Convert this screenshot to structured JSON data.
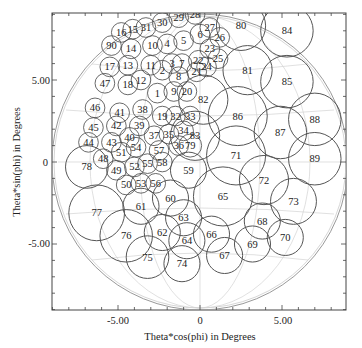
{
  "figure": {
    "xlabel": "Theta*cos(phi) in Degrees",
    "ylabel": "Theta*sin(phi) in Degrees",
    "x_ticks": [
      "-5.00",
      "0",
      "5.00"
    ],
    "y_ticks": [
      "5.00",
      "0",
      "-5.00"
    ],
    "colors": {
      "frame": "#444444",
      "circle": "#333333",
      "grid": "#bbbbbb",
      "text": "#222222"
    }
  },
  "chart_data": {
    "type": "scatter",
    "title": "",
    "xlabel": "Theta*cos(phi) in Degrees",
    "ylabel": "Theta*sin(phi) in Degrees",
    "xlim": [
      -9,
      9
    ],
    "ylim": [
      -9,
      9
    ],
    "grid": false,
    "beams": [
      {
        "id": "1",
        "x": -2.6,
        "y": 4.2,
        "r": 0.6
      },
      {
        "id": "2",
        "x": -2.3,
        "y": 5.6,
        "r": 0.6
      },
      {
        "id": "3",
        "x": -1.7,
        "y": 6.0,
        "r": 0.6
      },
      {
        "id": "4",
        "x": -2.0,
        "y": 7.2,
        "r": 0.6
      },
      {
        "id": "5",
        "x": -1.0,
        "y": 7.4,
        "r": 0.6
      },
      {
        "id": "6",
        "x": 0.0,
        "y": 7.8,
        "r": 0.6
      },
      {
        "id": "7",
        "x": -1.1,
        "y": 6.0,
        "r": 0.6
      },
      {
        "id": "8",
        "x": -1.3,
        "y": 5.2,
        "r": 0.6
      },
      {
        "id": "9",
        "x": -1.6,
        "y": 4.3,
        "r": 0.6
      },
      {
        "id": "10",
        "x": -2.9,
        "y": 7.1,
        "r": 0.6
      },
      {
        "id": "11",
        "x": -3.0,
        "y": 5.9,
        "r": 0.6
      },
      {
        "id": "12",
        "x": -3.6,
        "y": 5.0,
        "r": 0.6
      },
      {
        "id": "13",
        "x": -4.4,
        "y": 5.9,
        "r": 0.6
      },
      {
        "id": "14",
        "x": -4.2,
        "y": 6.9,
        "r": 0.6
      },
      {
        "id": "15",
        "x": -4.1,
        "y": 8.1,
        "r": 0.6
      },
      {
        "id": "16",
        "x": -4.8,
        "y": 7.9,
        "r": 0.6
      },
      {
        "id": "17",
        "x": -5.5,
        "y": 5.8,
        "r": 0.6
      },
      {
        "id": "18",
        "x": -4.4,
        "y": 4.7,
        "r": 0.6
      },
      {
        "id": "19",
        "x": -2.3,
        "y": 2.8,
        "r": 0.6
      },
      {
        "id": "20",
        "x": -0.8,
        "y": 4.3,
        "r": 0.6
      },
      {
        "id": "21",
        "x": -0.2,
        "y": 5.5,
        "r": 0.6
      },
      {
        "id": "22",
        "x": -0.1,
        "y": 6.2,
        "r": 0.6
      },
      {
        "id": "23",
        "x": 0.6,
        "y": 6.9,
        "r": 0.6
      },
      {
        "id": "24",
        "x": 0.4,
        "y": 5.8,
        "r": 0.6
      },
      {
        "id": "25",
        "x": 1.1,
        "y": 6.3,
        "r": 0.6
      },
      {
        "id": "26",
        "x": 1.2,
        "y": 7.6,
        "r": 0.6
      },
      {
        "id": "27",
        "x": 0.6,
        "y": 8.2,
        "r": 0.6
      },
      {
        "id": "28",
        "x": -0.3,
        "y": 9.0,
        "r": 0.6
      },
      {
        "id": "29",
        "x": -1.3,
        "y": 8.8,
        "r": 0.6
      },
      {
        "id": "30",
        "x": -2.3,
        "y": 8.5,
        "r": 0.6
      },
      {
        "id": "31",
        "x": -3.3,
        "y": 8.2,
        "r": 0.6
      },
      {
        "id": "32",
        "x": -1.5,
        "y": 2.8,
        "r": 0.6
      },
      {
        "id": "33",
        "x": -0.6,
        "y": 2.8,
        "r": 0.6
      },
      {
        "id": "34",
        "x": -1.0,
        "y": 1.9,
        "r": 0.6
      },
      {
        "id": "35",
        "x": -1.9,
        "y": 1.7,
        "r": 0.6
      },
      {
        "id": "36",
        "x": -1.3,
        "y": 1.0,
        "r": 0.6
      },
      {
        "id": "37",
        "x": -2.8,
        "y": 1.6,
        "r": 0.6
      },
      {
        "id": "38",
        "x": -3.5,
        "y": 3.2,
        "r": 0.6
      },
      {
        "id": "39",
        "x": -3.7,
        "y": 2.2,
        "r": 0.6
      },
      {
        "id": "40",
        "x": -4.3,
        "y": 1.5,
        "r": 0.6
      },
      {
        "id": "41",
        "x": -4.9,
        "y": 3.0,
        "r": 0.6
      },
      {
        "id": "42",
        "x": -5.1,
        "y": 2.2,
        "r": 0.6
      },
      {
        "id": "43",
        "x": -5.4,
        "y": 1.2,
        "r": 0.6
      },
      {
        "id": "44",
        "x": -6.8,
        "y": 1.2,
        "r": 0.6
      },
      {
        "id": "45",
        "x": -6.5,
        "y": 2.1,
        "r": 0.6
      },
      {
        "id": "46",
        "x": -6.4,
        "y": 3.3,
        "r": 0.6
      },
      {
        "id": "47",
        "x": -5.8,
        "y": 4.8,
        "r": 0.6
      },
      {
        "id": "48",
        "x": -5.9,
        "y": 0.2,
        "r": 0.6
      },
      {
        "id": "49",
        "x": -5.1,
        "y": -0.5,
        "r": 0.6
      },
      {
        "id": "50",
        "x": -4.5,
        "y": -1.4,
        "r": 0.6
      },
      {
        "id": "51",
        "x": -4.8,
        "y": 0.6,
        "r": 0.6
      },
      {
        "id": "52",
        "x": -4.0,
        "y": -0.3,
        "r": 0.6
      },
      {
        "id": "53",
        "x": -3.6,
        "y": -1.3,
        "r": 0.6
      },
      {
        "id": "54",
        "x": -3.9,
        "y": 0.9,
        "r": 0.6
      },
      {
        "id": "55",
        "x": -3.2,
        "y": -0.1,
        "r": 0.6
      },
      {
        "id": "56",
        "x": -2.7,
        "y": -1.3,
        "r": 0.6
      },
      {
        "id": "57",
        "x": -2.5,
        "y": 0.7,
        "r": 0.6
      },
      {
        "id": "58",
        "x": -2.3,
        "y": 0.0,
        "r": 0.6
      },
      {
        "id": "59",
        "x": -0.7,
        "y": -0.5,
        "r": 1.1
      },
      {
        "id": "60",
        "x": -1.8,
        "y": -2.2,
        "r": 1.1
      },
      {
        "id": "61",
        "x": -3.6,
        "y": -2.7,
        "r": 1.1
      },
      {
        "id": "62",
        "x": -2.3,
        "y": -4.3,
        "r": 1.1
      },
      {
        "id": "63",
        "x": -1.0,
        "y": -3.4,
        "r": 1.1
      },
      {
        "id": "64",
        "x": -0.8,
        "y": -4.8,
        "r": 1.1
      },
      {
        "id": "65",
        "x": 1.4,
        "y": -2.1,
        "r": 1.8
      },
      {
        "id": "66",
        "x": 0.7,
        "y": -4.4,
        "r": 1.1
      },
      {
        "id": "67",
        "x": 1.5,
        "y": -5.7,
        "r": 1.1
      },
      {
        "id": "68",
        "x": 3.8,
        "y": -3.6,
        "r": 1.1
      },
      {
        "id": "69",
        "x": 3.2,
        "y": -5.0,
        "r": 1.1
      },
      {
        "id": "70",
        "x": 5.2,
        "y": -4.6,
        "r": 1.1
      },
      {
        "id": "71",
        "x": 2.2,
        "y": 0.4,
        "r": 1.8
      },
      {
        "id": "72",
        "x": 3.9,
        "y": -1.1,
        "r": 1.5
      },
      {
        "id": "73",
        "x": 5.7,
        "y": -2.4,
        "r": 1.4
      },
      {
        "id": "74",
        "x": -1.1,
        "y": -6.2,
        "r": 1.1
      },
      {
        "id": "75",
        "x": -3.2,
        "y": -5.8,
        "r": 1.3
      },
      {
        "id": "76",
        "x": -4.5,
        "y": -4.5,
        "r": 1.6
      },
      {
        "id": "77",
        "x": -6.3,
        "y": -3.1,
        "r": 1.7
      },
      {
        "id": "78",
        "x": -6.9,
        "y": -0.3,
        "r": 1.3
      },
      {
        "id": "79",
        "x": -0.6,
        "y": 1.0,
        "r": 0.7
      },
      {
        "id": "80",
        "x": 2.5,
        "y": 8.3,
        "r": 1.5
      },
      {
        "id": "81",
        "x": 2.9,
        "y": 5.6,
        "r": 1.5
      },
      {
        "id": "82",
        "x": 0.2,
        "y": 3.8,
        "r": 1.5
      },
      {
        "id": "83",
        "x": -0.3,
        "y": 1.6,
        "r": 1.5
      },
      {
        "id": "84",
        "x": 5.3,
        "y": 8.0,
        "r": 1.6
      },
      {
        "id": "85",
        "x": 5.3,
        "y": 4.9,
        "r": 1.6
      },
      {
        "id": "86",
        "x": 2.3,
        "y": 2.8,
        "r": 1.8
      },
      {
        "id": "87",
        "x": 4.9,
        "y": 1.8,
        "r": 1.6
      },
      {
        "id": "88",
        "x": 7.0,
        "y": 2.6,
        "r": 1.6
      },
      {
        "id": "89",
        "x": 7.0,
        "y": 0.2,
        "r": 1.6
      },
      {
        "id": "90",
        "x": -5.4,
        "y": 7.1,
        "r": 0.6
      }
    ]
  }
}
